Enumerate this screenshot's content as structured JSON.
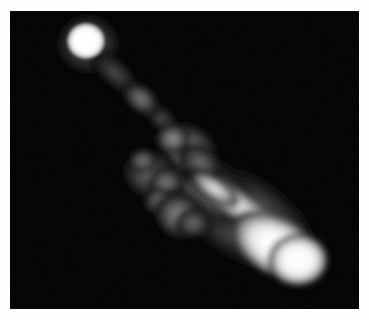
{
  "figure": {
    "type": "grayscale-astronomical-image",
    "width_px": 369,
    "height_px": 320,
    "background_color": "#fefefe",
    "sky_background_color": "#000000",
    "peak_color": "#ffffff"
  },
  "frame": {
    "left_px": 10,
    "top_px": 11,
    "width_px": 349,
    "height_px": 298,
    "border_color": "#000000"
  },
  "chart_data": {
    "type": "heatmap",
    "xlabel": "",
    "ylabel": "",
    "colormap": "grayscale",
    "value_min": 0,
    "value_max": 255,
    "grid": false,
    "legend": "none",
    "xlim": [
      0,
      349
    ],
    "ylim": [
      0,
      298
    ],
    "features": [
      {
        "name": "core",
        "label": "compact bright core",
        "cx": 76,
        "cy": 30,
        "rx": 20,
        "ry": 19,
        "peak_intensity": 255,
        "angle_deg": 0
      },
      {
        "name": "core-halo",
        "label": "core diffuse halo",
        "cx": 78,
        "cy": 33,
        "rx": 32,
        "ry": 30,
        "peak_intensity": 70,
        "angle_deg": 0
      },
      {
        "name": "jet-inner",
        "label": "inner jet bridge",
        "cx": 105,
        "cy": 62,
        "rx": 30,
        "ry": 13,
        "peak_intensity": 62,
        "angle_deg": 42
      },
      {
        "name": "jet-knot-a",
        "label": "jet knot A",
        "cx": 131,
        "cy": 88,
        "rx": 20,
        "ry": 13,
        "peak_intensity": 105,
        "angle_deg": 40
      },
      {
        "name": "jet-outer",
        "label": "outer jet bridge",
        "cx": 152,
        "cy": 108,
        "rx": 22,
        "ry": 11,
        "peak_intensity": 48,
        "angle_deg": 42
      },
      {
        "name": "central-blob",
        "label": "central knotty emission",
        "cx": 178,
        "cy": 140,
        "rx": 32,
        "ry": 26,
        "peak_intensity": 125,
        "angle_deg": 38
      },
      {
        "name": "central-knot-b",
        "label": "central knot B",
        "cx": 163,
        "cy": 128,
        "rx": 17,
        "ry": 15,
        "peak_intensity": 132,
        "angle_deg": 0
      },
      {
        "name": "diffuse-west",
        "label": "western diffuse patch",
        "cx": 140,
        "cy": 163,
        "rx": 28,
        "ry": 24,
        "peak_intensity": 86,
        "angle_deg": 20
      },
      {
        "name": "diffuse-knot-c",
        "label": "diffuse knot C",
        "cx": 156,
        "cy": 172,
        "rx": 18,
        "ry": 16,
        "peak_intensity": 96,
        "angle_deg": 0
      },
      {
        "name": "diffuse-south",
        "label": "southern diffuse patch",
        "cx": 170,
        "cy": 205,
        "rx": 26,
        "ry": 22,
        "peak_intensity": 104,
        "angle_deg": 30
      },
      {
        "name": "ridge",
        "label": "bright jet ridge",
        "cx": 225,
        "cy": 192,
        "rx": 56,
        "ry": 15,
        "peak_intensity": 210,
        "angle_deg": 33
      },
      {
        "name": "lobe-envelope",
        "label": "lobe diffuse envelope",
        "cx": 232,
        "cy": 205,
        "rx": 86,
        "ry": 41,
        "peak_intensity": 115,
        "angle_deg": 32
      },
      {
        "name": "hotspot",
        "label": "terminal hotspot",
        "cx": 268,
        "cy": 236,
        "rx": 50,
        "ry": 29,
        "peak_intensity": 255,
        "angle_deg": 30
      },
      {
        "name": "hotspot-tip",
        "label": "hotspot rounded tip",
        "cx": 288,
        "cy": 249,
        "rx": 30,
        "ry": 26,
        "peak_intensity": 255,
        "angle_deg": 0
      }
    ]
  }
}
